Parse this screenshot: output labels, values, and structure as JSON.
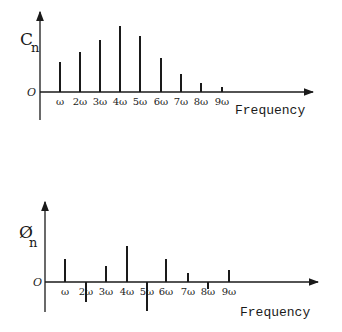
{
  "chart_data": [
    {
      "type": "bar",
      "subtype": "stem / line spectrum",
      "title": "",
      "ylabel": "C_n",
      "ylabel_main": "C",
      "ylabel_sub": "n",
      "xlabel": "Frequency",
      "origin_label": "O",
      "categories": [
        "ω",
        "2ω",
        "3ω",
        "4ω",
        "5ω",
        "6ω",
        "7ω",
        "8ω",
        "9ω"
      ],
      "values": [
        30,
        40,
        52,
        66,
        56,
        34,
        18,
        9,
        5
      ],
      "ylim": [
        0,
        80
      ],
      "grid": false,
      "legend": "none"
    },
    {
      "type": "bar",
      "subtype": "stem / line spectrum",
      "title": "",
      "ylabel": "Ø_n",
      "ylabel_main": "Ø",
      "ylabel_sub": "n",
      "xlabel": "Frequency",
      "origin_label": "O",
      "categories": [
        "ω",
        "2ω",
        "3ω",
        "4ω",
        "5ω",
        "6ω",
        "7ω",
        "8ω",
        "9ω"
      ],
      "values": [
        23,
        -20,
        16,
        36,
        -29,
        23,
        9,
        -7,
        12
      ],
      "ylim": [
        -30,
        80
      ],
      "grid": false,
      "legend": "none"
    }
  ],
  "layout": {
    "top": {
      "axis_x": 40,
      "axis_top": 12,
      "axis_bottom": 120,
      "baseline": 92,
      "arrow_end": 313,
      "x_positions": [
        60,
        80,
        100,
        120,
        140,
        161,
        181,
        201,
        222
      ],
      "px_per_unit": 1.0
    },
    "bottom": {
      "axis_x": 45,
      "axis_top": 202,
      "axis_bottom": 312,
      "baseline": 282,
      "arrow_end": 318,
      "x_positions": [
        65,
        86,
        106,
        127,
        147,
        166,
        188,
        208,
        229
      ],
      "px_per_unit": 1.0
    }
  }
}
